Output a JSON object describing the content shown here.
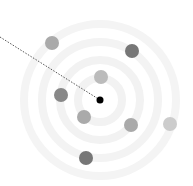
{
  "diagram": {
    "type": "radar-target",
    "center": {
      "x": 100,
      "y": 100,
      "r": 3.5,
      "color": "#000000"
    },
    "rings": [
      {
        "r": 22,
        "width": 8,
        "color": "#f2f2f2"
      },
      {
        "r": 40,
        "width": 8,
        "color": "#f2f2f2"
      },
      {
        "r": 58,
        "width": 8,
        "color": "#f3f3f3"
      },
      {
        "r": 76,
        "width": 8,
        "color": "#f4f4f4"
      }
    ],
    "pointer_line": {
      "x1": 0,
      "y1": 37,
      "x2": 100,
      "y2": 100,
      "color": "#555555",
      "dash": "1.5 1.5"
    },
    "markers": [
      {
        "x": 52,
        "y": 43,
        "r": 7,
        "color": "#aaaaaa"
      },
      {
        "x": 132,
        "y": 51,
        "r": 7,
        "color": "#777777"
      },
      {
        "x": 101,
        "y": 77,
        "r": 7,
        "color": "#bbbbbb"
      },
      {
        "x": 61,
        "y": 95,
        "r": 7,
        "color": "#888888"
      },
      {
        "x": 84,
        "y": 117,
        "r": 7,
        "color": "#aaaaaa"
      },
      {
        "x": 131,
        "y": 125,
        "r": 7,
        "color": "#aaaaaa"
      },
      {
        "x": 170,
        "y": 124,
        "r": 7,
        "color": "#cccccc"
      },
      {
        "x": 86,
        "y": 158,
        "r": 7,
        "color": "#777777"
      }
    ]
  }
}
